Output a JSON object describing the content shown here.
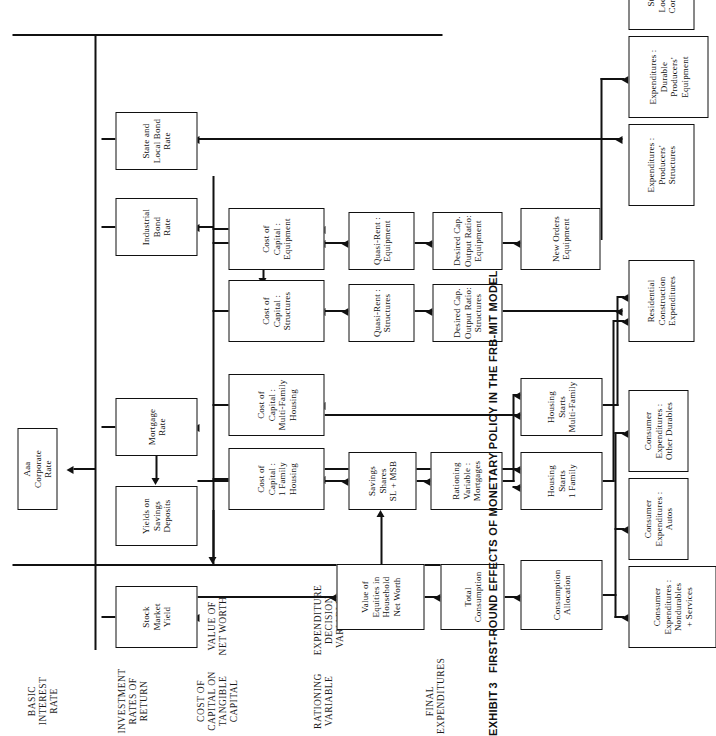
{
  "caption": {
    "exhibit_label": "EXHIBIT",
    "exhibit_number": "3",
    "title": "FIRST-ROUND EFFECTS OF MONETARY POLICY IN THE FRB-MIT MODEL"
  },
  "bands": [
    {
      "id": "final-expenditures",
      "label": "FINAL\nEXPENDITURES"
    },
    {
      "id": "expenditure-decision",
      "label": "EXPENDITURE\nDECISION VARIABLES"
    },
    {
      "id": "rationing-variable",
      "label": "RATIONING\nVARIABLE"
    },
    {
      "id": "value-of-net-worth",
      "label": "VALUE OF\nNET WORTH"
    },
    {
      "id": "cost-of-capital",
      "label": "COST OF\nCAPITAL ON\nTANGIBLE\nCAPITAL"
    },
    {
      "id": "investment-rates-of-return",
      "label": "INVESTMENT\nRATES OF\nRETURN"
    },
    {
      "id": "basic-interest-rate",
      "label": "BASIC\nINTEREST\nRATE"
    }
  ],
  "nodes": [
    {
      "id": "consumer-exp-nondurables",
      "label": "Consumer\nExpenditures :\nNondurables\n+ Services",
      "band": "final-expenditures"
    },
    {
      "id": "consumer-exp-autos",
      "label": "Consumer\nExpenditures :\nAutos",
      "band": "final-expenditures"
    },
    {
      "id": "consumer-exp-other-durables",
      "label": "Consumer\nExpenditures :\nOther Durables",
      "band": "final-expenditures"
    },
    {
      "id": "residential-construction-exp",
      "label": "Residential\nConstruction\nExpenditures",
      "band": "final-expenditures"
    },
    {
      "id": "exp-producers-structures",
      "label": "Expenditures :\nProducers'\nStructures",
      "band": "final-expenditures"
    },
    {
      "id": "exp-durable-producers-equipment",
      "label": "Expenditures :\nDurable\nProducers'\nEquipment",
      "band": "final-expenditures"
    },
    {
      "id": "state-local-govt-construction",
      "label": "State and\nLocal Gov't.\nConstruction",
      "band": "final-expenditures"
    },
    {
      "id": "consumption-allocation",
      "label": "Consumption\nAllocation",
      "band": "expenditure-decision"
    },
    {
      "id": "housing-starts-1-family",
      "label": "Housing Starts\n1 Family",
      "band": "expenditure-decision"
    },
    {
      "id": "housing-starts-multi-family",
      "label": "Housing Starts\nMulti-Family",
      "band": "expenditure-decision"
    },
    {
      "id": "new-orders-equipment",
      "label": "New Orders\nEquipment",
      "band": "expenditure-decision"
    },
    {
      "id": "total-consumption",
      "label": "Total\nConsumption",
      "band": "rationing-variable"
    },
    {
      "id": "rationing-variable-mortgages",
      "label": "Rationing\nVariable :\nMortgages",
      "band": "rationing-variable"
    },
    {
      "id": "desired-cap-output-ratio-structures",
      "label": "Desired Cap.\nOutput Ratio:\nStructures",
      "band": "rationing-variable"
    },
    {
      "id": "desired-cap-output-ratio-equipment",
      "label": "Desired Cap.\nOutput Ratio:\nEquipment",
      "band": "rationing-variable"
    },
    {
      "id": "value-of-equities",
      "label": "Value of\nEquities in\nHousehold\nNet Worth",
      "band": "value-of-net-worth"
    },
    {
      "id": "savings-shares-sl-msb",
      "label": "Savings\nShares\nSL + MSB",
      "band": "value-of-net-worth"
    },
    {
      "id": "quasi-rent-structures",
      "label": "Quasi-Rent :\nStructures",
      "band": "value-of-net-worth"
    },
    {
      "id": "quasi-rent-equipment",
      "label": "Quasi-Rent :\nEquipment",
      "band": "value-of-net-worth"
    },
    {
      "id": "cost-of-capital-1-family-housing",
      "label": "Cost of\nCapital :\n1 Family\nHousing",
      "band": "cost-of-capital"
    },
    {
      "id": "cost-of-capital-multi-family-housing",
      "label": "Cost of\nCapital :\nMulti-Family\nHousing",
      "band": "cost-of-capital"
    },
    {
      "id": "cost-of-capital-structures",
      "label": "Cost of\nCapital :\nStructures",
      "band": "cost-of-capital"
    },
    {
      "id": "cost-of-capital-equipment",
      "label": "Cost of\nCapital :\nEquipment",
      "band": "cost-of-capital"
    },
    {
      "id": "stock-market-yield",
      "label": "Stock\nMarket\nYield",
      "band": "investment-rates-of-return"
    },
    {
      "id": "yields-on-savings-deposits",
      "label": "Yields on\nSavings\nDeposits",
      "band": "investment-rates-of-return"
    },
    {
      "id": "mortgage-rate",
      "label": "Mortgage\nRate",
      "band": "investment-rates-of-return"
    },
    {
      "id": "industrial-bond-rate",
      "label": "Industrial\nBond\nRate",
      "band": "investment-rates-of-return"
    },
    {
      "id": "state-local-bond-rate",
      "label": "State and\nLocal Bond\nRate",
      "band": "investment-rates-of-return"
    },
    {
      "id": "aaa-corporate-rate",
      "label": "Aaa\nCorporate\nRate",
      "band": "basic-interest-rate"
    }
  ],
  "colors": {
    "ink": "#111111",
    "paper": "#ffffff"
  }
}
